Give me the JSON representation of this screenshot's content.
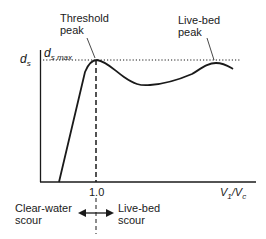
{
  "diagram": {
    "y_axis_label": "d",
    "y_axis_label_sub": "s",
    "y_max_label": "d",
    "y_max_label_sub": "s max",
    "x_axis_label_v1": "V",
    "x_axis_label_v1_sub": "1",
    "x_axis_label_slash": "/V",
    "x_axis_label_vc_sub": "c",
    "x_tick_label": "1.0",
    "annotations": {
      "threshold_peak_line1": "Threshold",
      "threshold_peak_line2": "peak",
      "live_bed_peak_line1": "Live-bed",
      "live_bed_peak_line2": "peak"
    },
    "regions": {
      "left_line1": "Clear-water",
      "left_line2": "scour",
      "right_line1": "Live-bed",
      "right_line2": "scour"
    },
    "colors": {
      "ink": "#1a1a1a",
      "background": "#ffffff"
    }
  }
}
